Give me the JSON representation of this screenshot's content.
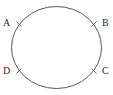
{
  "figure": {
    "type": "geometry-diagram",
    "background_color": "#ffffff",
    "stroke_color": "#555555",
    "label_color": "#2b2b2b",
    "shape": {
      "name": "circle",
      "center_x": 56.5,
      "center_y": 47.5,
      "radius_x": 45,
      "radius_y": 41,
      "stroke_width": 1
    },
    "points": [
      {
        "id": "A",
        "label": "A",
        "angle_deg": 145,
        "tick_x": 19,
        "tick_y": 24,
        "label_x": 3,
        "label_y": 18
      },
      {
        "id": "B",
        "label": "B",
        "angle_deg": 35,
        "tick_x": 94,
        "tick_y": 24,
        "label_x": 102,
        "label_y": 18
      },
      {
        "id": "C",
        "label": "C",
        "angle_deg": 325,
        "tick_x": 94,
        "tick_y": 71,
        "label_x": 102,
        "label_y": 66
      },
      {
        "id": "D",
        "label": "D",
        "angle_deg": 215,
        "tick_x": 19,
        "tick_y": 71,
        "label_x": 3,
        "label_y": 66
      }
    ]
  }
}
